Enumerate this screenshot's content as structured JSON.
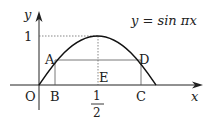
{
  "figure": {
    "equation": "y = sin πx",
    "axes": {
      "x_label": "x",
      "y_label": "y",
      "origin_label": "O"
    },
    "ticks": {
      "y_one": "1",
      "x_half_num": "1",
      "x_half_den": "2"
    },
    "points": {
      "A": "A",
      "B": "B",
      "C": "C",
      "D": "D",
      "E": "E"
    },
    "colors": {
      "curve": "#111111",
      "axis": "#222222",
      "rect": "#555555",
      "dashed": "#555555"
    }
  }
}
